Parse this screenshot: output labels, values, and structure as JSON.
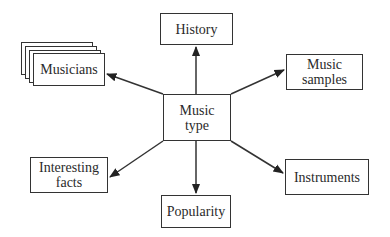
{
  "diagram": {
    "center": {
      "id": "music-type",
      "label_line1": "Music",
      "label_line2": "type"
    },
    "nodes": [
      {
        "id": "history",
        "label_line1": "History",
        "label_line2": ""
      },
      {
        "id": "music-samples",
        "label_line1": "Music",
        "label_line2": "samples"
      },
      {
        "id": "musicians",
        "label_line1": "Musicians",
        "label_line2": "",
        "stacked": true
      },
      {
        "id": "interesting-facts",
        "label_line1": "Interesting",
        "label_line2": "facts"
      },
      {
        "id": "popularity",
        "label_line1": "Popularity",
        "label_line2": ""
      },
      {
        "id": "instruments",
        "label_line1": "Instruments",
        "label_line2": ""
      }
    ],
    "edges": [
      {
        "from": "music-type",
        "to": "history"
      },
      {
        "from": "music-type",
        "to": "music-samples"
      },
      {
        "from": "music-type",
        "to": "musicians"
      },
      {
        "from": "music-type",
        "to": "interesting-facts"
      },
      {
        "from": "music-type",
        "to": "popularity"
      },
      {
        "from": "music-type",
        "to": "instruments"
      }
    ],
    "colors": {
      "stroke": "#333333",
      "text": "#2a2a2a",
      "background": "#ffffff"
    }
  }
}
